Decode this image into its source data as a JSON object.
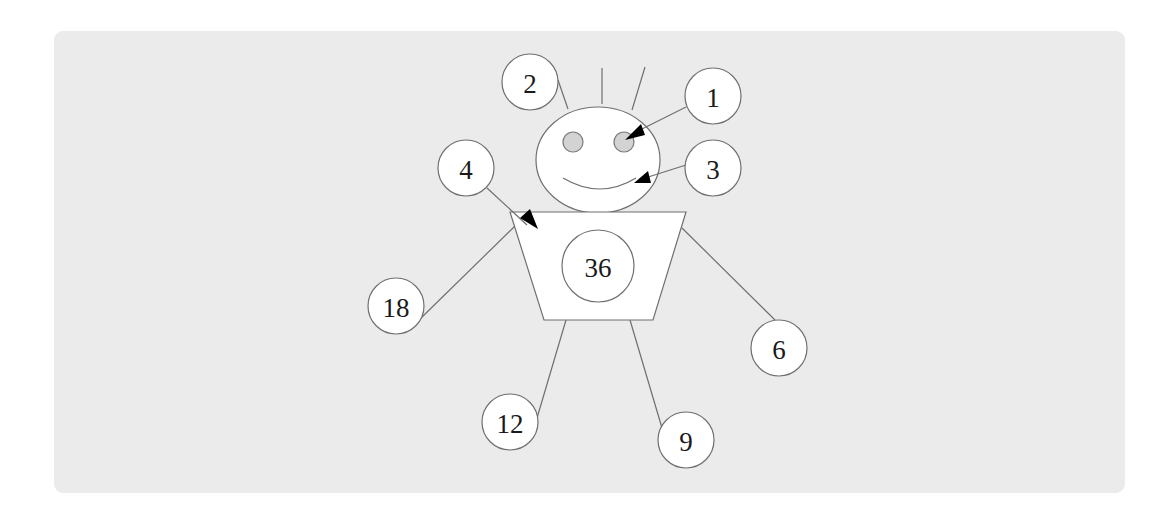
{
  "diagram": {
    "title": "",
    "background_color": "#ebebeb",
    "figure": "stick figure with numbered callout circles",
    "center_label": "36",
    "callouts": [
      {
        "id": "hair",
        "label": "2",
        "target": "hair"
      },
      {
        "id": "eye",
        "label": "1",
        "target": "right eye"
      },
      {
        "id": "mouth",
        "label": "3",
        "target": "smile"
      },
      {
        "id": "body",
        "label": "4",
        "target": "torso corner"
      },
      {
        "id": "left-arm",
        "label": "18",
        "target": "left arm"
      },
      {
        "id": "right-arm",
        "label": "6",
        "target": "right arm"
      },
      {
        "id": "left-leg",
        "label": "12",
        "target": "left leg"
      },
      {
        "id": "right-leg",
        "label": "9",
        "target": "right leg"
      }
    ]
  }
}
